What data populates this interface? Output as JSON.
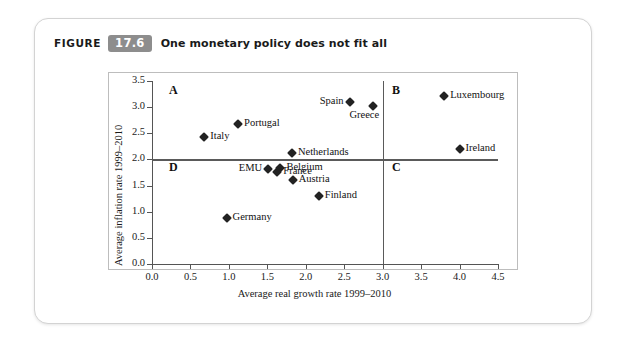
{
  "figure": {
    "label": "FIGURE",
    "number": "17.6",
    "title": "One monetary policy does not fit all"
  },
  "chart_data": {
    "type": "scatter",
    "title": "One monetary policy does not fit all",
    "xlabel": "Average real growth rate 1999–2010",
    "ylabel": "Average inflation rate 1999–2010",
    "xlim": [
      0.0,
      4.5
    ],
    "ylim": [
      0.0,
      3.5
    ],
    "xticks": [
      "0.0",
      "0.5",
      "1.0",
      "1.5",
      "2.0",
      "2.5",
      "3.0",
      "3.5",
      "4.0",
      "4.5"
    ],
    "yticks": [
      "0.0",
      "0.5",
      "1.0",
      "1.5",
      "2.0",
      "2.5",
      "3.0",
      "3.5"
    ],
    "grid": false,
    "legend": "none",
    "reference_lines": {
      "vertical_x": 3.0,
      "horizontal_y": 2.0
    },
    "quadrant_labels": [
      {
        "name": "A",
        "x": 0.22,
        "y": 3.33
      },
      {
        "name": "B",
        "x": 3.12,
        "y": 3.33
      },
      {
        "name": "C",
        "x": 3.12,
        "y": 1.86
      },
      {
        "name": "D",
        "x": 0.22,
        "y": 1.86
      }
    ],
    "points": [
      {
        "name": "Italy",
        "x": 0.68,
        "y": 2.43,
        "label_pos": "right"
      },
      {
        "name": "Portugal",
        "x": 1.12,
        "y": 2.67,
        "label_pos": "right"
      },
      {
        "name": "Germany",
        "x": 0.97,
        "y": 0.88,
        "label_pos": "right"
      },
      {
        "name": "EMU",
        "x": 1.51,
        "y": 1.81,
        "label_pos": "left"
      },
      {
        "name": "France",
        "x": 1.63,
        "y": 1.76,
        "label_pos": "right"
      },
      {
        "name": "Belgium",
        "x": 1.67,
        "y": 1.84,
        "label_pos": "right"
      },
      {
        "name": "Netherlands",
        "x": 1.82,
        "y": 2.12,
        "label_pos": "right"
      },
      {
        "name": "Austria",
        "x": 1.83,
        "y": 1.6,
        "label_pos": "right"
      },
      {
        "name": "Finland",
        "x": 2.17,
        "y": 1.3,
        "label_pos": "right"
      },
      {
        "name": "Spain",
        "x": 2.57,
        "y": 3.09,
        "label_pos": "left"
      },
      {
        "name": "Greece",
        "x": 2.88,
        "y": 3.02,
        "label_pos": "below"
      },
      {
        "name": "Luxembourg",
        "x": 3.8,
        "y": 3.22,
        "label_pos": "right"
      },
      {
        "name": "Ireland",
        "x": 4.0,
        "y": 2.19,
        "label_pos": "right"
      }
    ]
  }
}
